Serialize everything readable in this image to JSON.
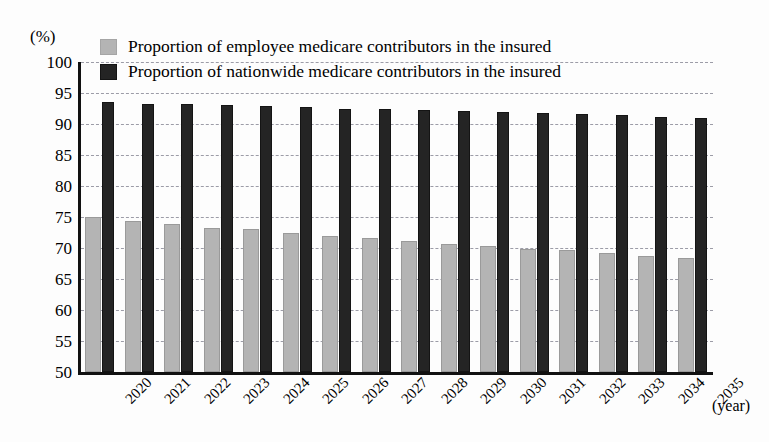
{
  "chart_data": {
    "type": "bar",
    "title": "",
    "xlabel": "(year)",
    "ylabel": "(%)",
    "ylim": [
      50,
      100
    ],
    "ytick_step": 5,
    "yticks": [
      100,
      95,
      90,
      85,
      80,
      75,
      70,
      65,
      60,
      55,
      50
    ],
    "grid": true,
    "legend_position": "top-left-inside",
    "categories": [
      "2020",
      "2021",
      "2022",
      "2023",
      "2024",
      "2025",
      "2026",
      "2027",
      "2028",
      "2029",
      "2030",
      "2031",
      "2032",
      "2033",
      "2034",
      "2035"
    ],
    "series": [
      {
        "name": "Proportion of employee medicare contributors in the insured",
        "color": "#b4b4b4",
        "values": [
          75.0,
          74.3,
          73.8,
          73.3,
          73.0,
          72.4,
          72.0,
          71.6,
          71.2,
          70.6,
          70.3,
          69.9,
          69.6,
          69.2,
          68.7,
          68.4
        ]
      },
      {
        "name": "Proportion of nationwide medicare contributors in the insured",
        "color": "#242424",
        "values": [
          93.5,
          93.3,
          93.2,
          93.0,
          92.9,
          92.7,
          92.5,
          92.4,
          92.2,
          92.1,
          92.0,
          91.8,
          91.6,
          91.4,
          91.2,
          91.0
        ]
      }
    ]
  },
  "axis": {
    "y_unit_label": "(%)",
    "x_unit_label": "(year)"
  }
}
